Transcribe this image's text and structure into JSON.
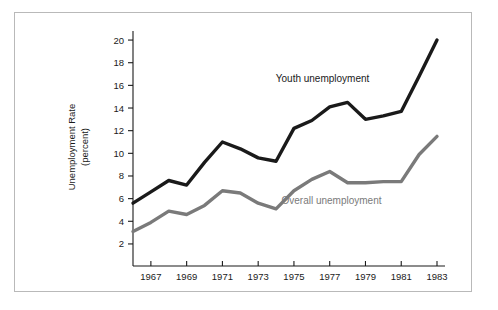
{
  "figure": {
    "frame_border_color": "#b9b9b9",
    "background": "#ffffff"
  },
  "chart_data": {
    "type": "line",
    "title": "",
    "xlabel": "",
    "ylabel": "Unemployment Rate\n(percent)",
    "ylabel_line1": "Unemployment Rate",
    "ylabel_line2": "(percent)",
    "xlim": [
      1966,
      1983
    ],
    "ylim": [
      1.2,
      20.8
    ],
    "yticks": [
      2,
      4,
      6,
      8,
      10,
      12,
      14,
      16,
      18,
      20
    ],
    "ytick_labels": [
      "2",
      "4",
      "6",
      "8",
      "10",
      "12",
      "14",
      "16",
      "18",
      "20"
    ],
    "xticks": [
      1967,
      1969,
      1971,
      1973,
      1975,
      1977,
      1979,
      1981,
      1983
    ],
    "xtick_labels": [
      "1967",
      "1969",
      "1971",
      "1973",
      "1975",
      "1977",
      "1979",
      "1981",
      "1983"
    ],
    "grid": false,
    "legend_position": "inline-annotation",
    "x": [
      1966,
      1967,
      1968,
      1969,
      1970,
      1971,
      1972,
      1973,
      1974,
      1975,
      1976,
      1977,
      1978,
      1979,
      1980,
      1981,
      1982,
      1983
    ],
    "series": [
      {
        "name": "Youth unemployment",
        "color": "#1a1a1a",
        "stroke_width": 3.4,
        "values": [
          5.6,
          6.6,
          7.6,
          7.2,
          9.2,
          11.0,
          10.4,
          9.6,
          9.3,
          12.2,
          12.9,
          14.1,
          14.5,
          13.0,
          13.3,
          13.7,
          16.8,
          20.0
        ],
        "label": "Youth unemployment",
        "label_x": 1976.6,
        "label_y": 16.3
      },
      {
        "name": "Overall unemployment",
        "color": "#7a7a7a",
        "stroke_width": 3.4,
        "values": [
          3.1,
          3.9,
          4.9,
          4.6,
          5.4,
          6.7,
          6.5,
          5.6,
          5.1,
          6.7,
          7.7,
          8.4,
          7.4,
          7.4,
          7.5,
          7.5,
          9.9,
          11.5
        ],
        "label": "Overall unemployment",
        "label_x": 1977.1,
        "label_y": 5.5
      }
    ]
  }
}
